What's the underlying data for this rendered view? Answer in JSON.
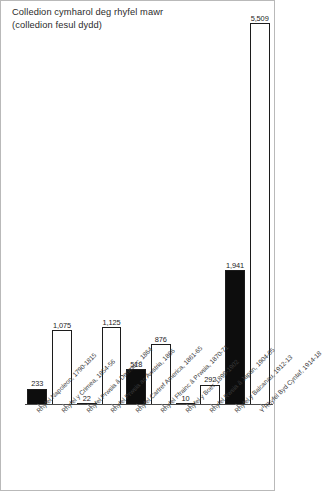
{
  "title": {
    "line1": "Colledion cymharol deg rhyfel mawr",
    "line2": "(colledion fesul dydd)"
  },
  "chart_data": {
    "type": "bar",
    "xlabel": "",
    "ylabel": "",
    "ylim": [
      0,
      5509
    ],
    "grid": false,
    "legend": "none",
    "categories": [
      "Rhyfel Napoleon, 1790-1815",
      "Rhyfel y Crimea, 1854-56",
      "Rhyfel Prwsia â Denmarc, 1864",
      "Rhyfel Prwsia ac Awstria, 1866",
      "Rhyfel Cartref America, 1861-65",
      "Rhyfel Ffrainc â Prwsia, 1870-71",
      "Rhyfel y Boer, 1899-1902",
      "Rhyfel Rwsia â Japan, 1904-05",
      "Rhyfel y Balcanau, 1912-13",
      "Y Rhyfel Byd Cyntaf, 1914-18"
    ],
    "values": [
      233,
      1075,
      22,
      1125,
      518,
      876,
      10,
      292,
      1941,
      5509
    ],
    "value_labels": [
      "233",
      "1,075",
      "22",
      "1,125",
      "518",
      "876",
      "10",
      "292",
      "1,941",
      "5,509"
    ],
    "bar_fills": [
      "black",
      "white",
      "black",
      "white",
      "black",
      "white",
      "black",
      "white",
      "black",
      "white"
    ],
    "colors": {
      "black_bar": "#0d0d0d",
      "white_bar": "#ffffff",
      "outline": "#1c1c1c",
      "axis": "#4a4a4a"
    }
  }
}
